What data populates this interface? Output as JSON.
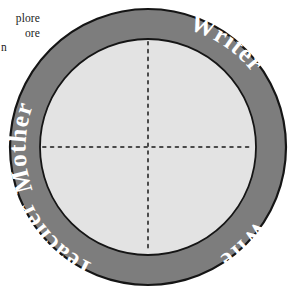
{
  "figure": {
    "type": "concentric-circle-role-diagram",
    "ring_color": "#7d7d7d",
    "ring_outline_color": "#1a1a1a",
    "interior_color": "#e3e3e3",
    "label_color": "#ffffff",
    "axis_style": "dotted",
    "axis_color": "#4a4a4a",
    "background_color": "#ffffff",
    "ring_labels": [
      {
        "text": "Mother",
        "position": "top-left"
      },
      {
        "text": "Writer",
        "position": "top-right"
      },
      {
        "text": "Wife",
        "position": "bottom-right"
      },
      {
        "text": "Teacher",
        "position": "bottom-left"
      }
    ]
  },
  "body_text": {
    "line1": "plore",
    "line2": "ore",
    "line3": "n"
  }
}
